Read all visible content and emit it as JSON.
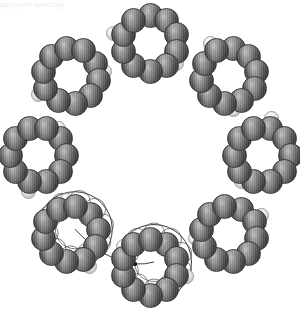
{
  "figure": {
    "caption_fragment": "porphyrin nanoring",
    "background_color": "#ffffff",
    "width": 300,
    "height": 313
  },
  "colors": {
    "dark_sphere": "#6e6e6e",
    "dark_sphere_edge": "#3a3a3a",
    "pale_sphere": "#e2e2e2",
    "pale_sphere_edge": "#9e9e9e",
    "wireframe": "#262626",
    "background": "#ffffff"
  },
  "structure": {
    "macro_ring": {
      "label": "macrocycle",
      "center_x": 150,
      "center_y": 155,
      "radius": 112,
      "cluster_count": 8,
      "start_angle_deg": -90
    },
    "cluster": {
      "label": "sub-ring unit",
      "sphere_count": 10,
      "sub_radius": 28,
      "dark_sphere_diameter": 25
    },
    "linker": {
      "label": "pale linker pair",
      "pair_count": 8,
      "pale_sphere_diameter": 15,
      "inner_offset": -17,
      "outer_offset": 15,
      "angular_spread_deg": 6
    },
    "wireframe_overlay": {
      "label": "line-art overlay",
      "present_on_clusters": [
        4,
        5
      ],
      "offset_x": 4,
      "offset_y": -5,
      "marker_dots": 3
    }
  }
}
